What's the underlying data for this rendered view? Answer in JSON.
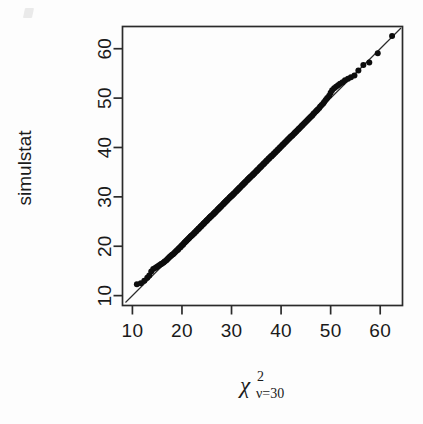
{
  "figure": {
    "background_color": "#fdfdfd",
    "ink_color": "#1a1a1a",
    "artifact_name": "scan-speck"
  },
  "axes": {
    "x_title_base": "χ",
    "x_title_superscript": "2",
    "x_title_subscript": "ν=30",
    "y_title": "simulstat"
  },
  "chart_data": {
    "type": "scatter",
    "title": "",
    "subtitle": "",
    "xlabel": "chi-squared, nu=30",
    "ylabel": "simulstat",
    "xlim": [
      8.0,
      64.5
    ],
    "ylim": [
      8.0,
      64.5
    ],
    "grid": false,
    "legend": null,
    "xticks": [
      10,
      20,
      30,
      40,
      50,
      60
    ],
    "yticks": [
      10,
      20,
      30,
      40,
      50,
      60
    ],
    "xtick_labels": [
      "10",
      "20",
      "30",
      "40",
      "50",
      "60"
    ],
    "ytick_labels": [
      "10",
      "20",
      "30",
      "40",
      "50",
      "60"
    ],
    "reference_line": {
      "name": "identity-line",
      "type": "line",
      "x": [
        8.6,
        64.2
      ],
      "y": [
        8.6,
        64.2
      ],
      "description": "y = x quantile reference line"
    },
    "series": [
      {
        "name": "qq-points",
        "marker": "filled-circle",
        "marker_size": 3.0,
        "color": "#0d0d0d",
        "x": [
          10.9,
          11.7,
          12.4,
          13.0,
          13.4,
          13.8,
          14.2,
          14.6,
          14.9,
          15.2,
          15.5,
          15.8,
          16.0,
          16.3,
          16.5,
          16.8,
          17.0,
          17.2,
          17.4,
          17.6,
          17.8,
          18.0,
          18.2,
          18.4,
          18.6,
          18.8,
          19.0,
          19.2,
          19.3,
          19.5,
          19.7,
          19.8,
          20.0,
          20.2,
          20.3,
          20.5,
          20.6,
          20.8,
          20.9,
          21.1,
          21.2,
          21.4,
          21.5,
          21.7,
          21.8,
          21.9,
          22.1,
          22.2,
          22.4,
          22.5,
          22.6,
          22.8,
          22.9,
          23.0,
          23.2,
          23.3,
          23.4,
          23.5,
          23.7,
          23.8,
          23.9,
          24.0,
          24.2,
          24.3,
          24.4,
          24.5,
          24.6,
          24.8,
          24.9,
          25.0,
          25.1,
          25.2,
          25.4,
          25.5,
          25.6,
          25.7,
          25.8,
          25.9,
          26.0,
          26.2,
          26.3,
          26.4,
          26.5,
          26.6,
          26.7,
          26.8,
          26.9,
          27.1,
          27.2,
          27.3,
          27.4,
          27.5,
          27.6,
          27.7,
          27.8,
          27.9,
          28.0,
          28.2,
          28.3,
          28.4,
          28.5,
          28.6,
          28.7,
          28.8,
          28.9,
          29.0,
          29.1,
          29.2,
          29.3,
          29.5,
          29.6,
          29.7,
          29.8,
          29.9,
          30.0,
          30.1,
          30.2,
          30.3,
          30.4,
          30.5,
          30.6,
          30.8,
          30.9,
          31.0,
          31.1,
          31.2,
          31.3,
          31.4,
          31.5,
          31.6,
          31.7,
          31.8,
          32.0,
          32.1,
          32.2,
          32.3,
          32.4,
          32.5,
          32.6,
          32.7,
          32.8,
          32.9,
          33.1,
          33.2,
          33.3,
          33.4,
          33.5,
          33.6,
          33.7,
          33.8,
          33.9,
          34.1,
          34.2,
          34.3,
          34.4,
          34.5,
          34.6,
          34.7,
          34.9,
          35.0,
          35.1,
          35.2,
          35.3,
          35.4,
          35.6,
          35.7,
          35.8,
          35.9,
          36.0,
          36.1,
          36.3,
          36.4,
          36.5,
          36.6,
          36.7,
          36.9,
          37.0,
          37.1,
          37.2,
          37.4,
          37.5,
          37.6,
          37.7,
          37.9,
          38.0,
          38.1,
          38.2,
          38.4,
          38.5,
          38.6,
          38.8,
          38.9,
          39.0,
          39.2,
          39.3,
          39.4,
          39.6,
          39.7,
          39.8,
          40.0,
          40.1,
          40.3,
          40.4,
          40.5,
          40.7,
          40.8,
          41.0,
          41.1,
          41.3,
          41.4,
          41.6,
          41.7,
          41.9,
          42.0,
          42.2,
          42.3,
          42.5,
          42.7,
          42.8,
          43.0,
          43.1,
          43.3,
          43.5,
          43.6,
          43.8,
          44.0,
          44.2,
          44.3,
          44.5,
          44.7,
          44.9,
          45.1,
          45.3,
          45.5,
          45.7,
          45.9,
          46.1,
          46.3,
          46.5,
          46.7,
          47.0,
          47.2,
          47.4,
          47.7,
          47.9,
          48.2,
          48.5,
          48.7,
          49.0,
          49.3,
          49.7,
          50.0,
          50.3,
          50.7,
          51.1,
          51.5,
          51.9,
          52.4,
          52.9,
          53.5,
          54.1,
          54.8,
          55.6,
          56.6,
          57.8,
          59.5,
          62.4
        ],
        "y": [
          12.3,
          12.5,
          13.0,
          13.6,
          14.1,
          14.9,
          15.4,
          15.6,
          15.8,
          16.0,
          16.2,
          16.4,
          16.5,
          16.7,
          16.9,
          17.1,
          17.3,
          17.5,
          17.7,
          17.9,
          18.1,
          18.3,
          18.4,
          18.6,
          18.8,
          19.0,
          19.2,
          19.3,
          19.5,
          19.7,
          19.8,
          20.0,
          20.2,
          20.3,
          20.5,
          20.7,
          20.8,
          21.0,
          21.1,
          21.3,
          21.4,
          21.6,
          21.7,
          21.9,
          22.0,
          22.1,
          22.3,
          22.4,
          22.6,
          22.7,
          22.8,
          23.0,
          23.1,
          23.2,
          23.4,
          23.5,
          23.6,
          23.7,
          23.9,
          24.0,
          24.1,
          24.2,
          24.4,
          24.5,
          24.6,
          24.7,
          24.8,
          25.0,
          25.1,
          25.2,
          25.3,
          25.4,
          25.6,
          25.7,
          25.8,
          25.9,
          26.0,
          26.1,
          26.2,
          26.4,
          26.5,
          26.6,
          26.7,
          26.8,
          26.9,
          27.0,
          27.1,
          27.3,
          27.4,
          27.5,
          27.6,
          27.7,
          27.8,
          27.9,
          28.0,
          28.1,
          28.2,
          28.4,
          28.5,
          28.6,
          28.7,
          28.8,
          28.9,
          29.0,
          29.1,
          29.2,
          29.3,
          29.4,
          29.5,
          29.7,
          29.8,
          29.9,
          30.0,
          30.1,
          30.2,
          30.3,
          30.4,
          30.5,
          30.6,
          30.7,
          30.8,
          31.0,
          31.1,
          31.2,
          31.3,
          31.4,
          31.5,
          31.6,
          31.7,
          31.8,
          31.9,
          32.0,
          32.2,
          32.3,
          32.4,
          32.5,
          32.6,
          32.7,
          32.8,
          32.9,
          33.0,
          33.1,
          33.3,
          33.4,
          33.5,
          33.6,
          33.7,
          33.8,
          33.9,
          34.0,
          34.1,
          34.3,
          34.4,
          34.5,
          34.6,
          34.7,
          34.8,
          34.9,
          35.1,
          35.2,
          35.3,
          35.4,
          35.5,
          35.6,
          35.8,
          35.9,
          36.0,
          36.1,
          36.2,
          36.3,
          36.5,
          36.6,
          36.7,
          36.8,
          36.9,
          37.1,
          37.2,
          37.3,
          37.4,
          37.6,
          37.7,
          37.8,
          37.9,
          38.1,
          38.2,
          38.3,
          38.4,
          38.6,
          38.7,
          38.8,
          39.0,
          39.1,
          39.2,
          39.4,
          39.5,
          39.6,
          39.8,
          39.9,
          40.0,
          40.2,
          40.3,
          40.5,
          40.6,
          40.7,
          40.9,
          41.0,
          41.2,
          41.3,
          41.5,
          41.6,
          41.8,
          41.9,
          42.1,
          42.2,
          42.4,
          42.5,
          42.7,
          42.9,
          43.0,
          43.2,
          43.3,
          43.5,
          43.7,
          43.8,
          44.0,
          44.2,
          44.4,
          44.5,
          44.7,
          44.9,
          45.1,
          45.3,
          45.5,
          45.7,
          45.9,
          46.1,
          46.3,
          46.5,
          46.8,
          47.0,
          47.3,
          47.5,
          47.7,
          48.0,
          48.3,
          48.6,
          48.9,
          49.2,
          49.6,
          50.0,
          50.5,
          51.1,
          51.6,
          52.0,
          52.3,
          52.6,
          52.9,
          53.2,
          53.6,
          53.9,
          54.2,
          54.6,
          55.6,
          56.7,
          57.2,
          59.1,
          62.6
        ]
      }
    ]
  }
}
